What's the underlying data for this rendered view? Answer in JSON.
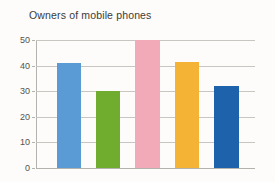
{
  "chart_data": {
    "type": "bar",
    "title": "Owners of mobile phones",
    "xlabel": "",
    "ylabel": "",
    "categories": [
      "1",
      "2",
      "3",
      "4",
      "5"
    ],
    "values": [
      41,
      30,
      50,
      41.5,
      32
    ],
    "colors": [
      "#5b9bd5",
      "#70ad2e",
      "#f2a9b8",
      "#f5b335",
      "#1f62ac"
    ],
    "ylim": [
      0,
      50
    ],
    "yticks": [
      0,
      10,
      20,
      30,
      40,
      50
    ],
    "ytick_labels": [
      "0",
      "10",
      "20",
      "30",
      "40",
      "50"
    ],
    "grid": true,
    "legend": false,
    "legend_position": "none",
    "background_color": "#fdfcfa",
    "gridline_color": "#c8c6c0",
    "axis_color": "#b4b2ac",
    "title_color": "#3b3b3b"
  }
}
